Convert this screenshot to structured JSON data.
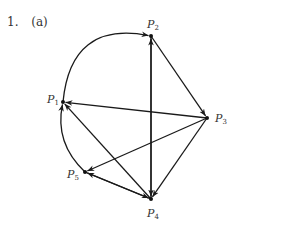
{
  "problem": {
    "number": "1.",
    "part": "(a)"
  },
  "graph": {
    "type": "directed",
    "nodes": [
      {
        "id": "P1",
        "label": "P",
        "sub": "1",
        "x": 63,
        "y": 102
      },
      {
        "id": "P2",
        "label": "P",
        "sub": "2",
        "x": 151,
        "y": 36
      },
      {
        "id": "P3",
        "label": "P",
        "sub": "3",
        "x": 207,
        "y": 118
      },
      {
        "id": "P4",
        "label": "P",
        "sub": "4",
        "x": 151,
        "y": 199
      },
      {
        "id": "P5",
        "label": "P",
        "sub": "5",
        "x": 85,
        "y": 172
      }
    ],
    "edges": [
      {
        "from": "P1",
        "to": "P2",
        "curved": true
      },
      {
        "from": "P2",
        "to": "P3"
      },
      {
        "from": "P3",
        "to": "P1"
      },
      {
        "from": "P4",
        "to": "P1"
      },
      {
        "from": "P5",
        "to": "P1",
        "curved": true
      },
      {
        "from": "P3",
        "to": "P5"
      },
      {
        "from": "P4",
        "to": "P2"
      },
      {
        "from": "P2",
        "to": "P4"
      },
      {
        "from": "P3",
        "to": "P4"
      },
      {
        "from": "P5",
        "to": "P4"
      },
      {
        "from": "P4",
        "to": "P5"
      }
    ]
  }
}
